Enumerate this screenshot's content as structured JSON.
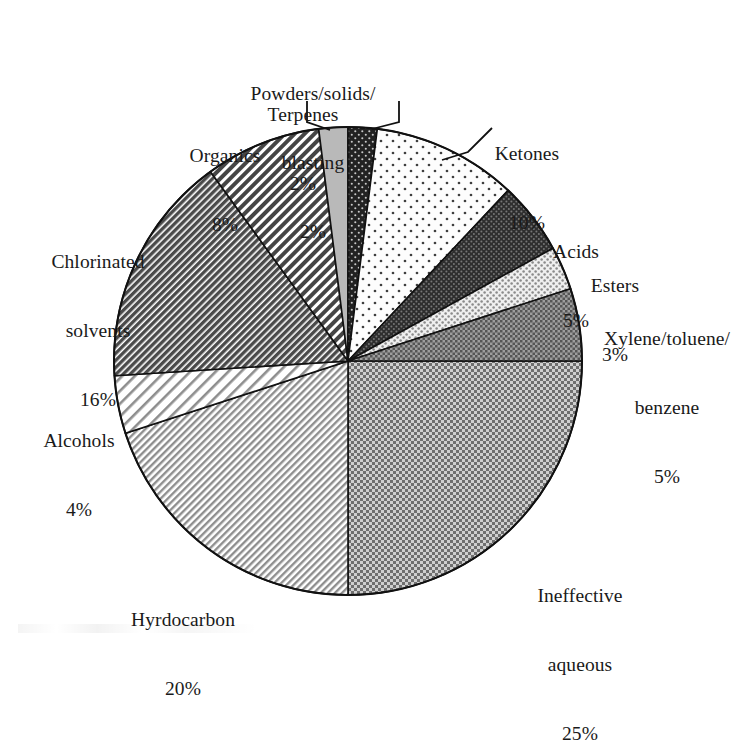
{
  "chart_data": {
    "type": "pie",
    "title": "",
    "subtitle": "",
    "xlabel": "",
    "ylabel": "",
    "legend_position": "none",
    "grid": false,
    "start_angle_deg": 0,
    "direction": "clockwise",
    "units": "percent",
    "total": 100,
    "categories": [
      "Ineffective aqueous",
      "Hyrdocarbon",
      "Alcohols",
      "Chlorinated solvents",
      "Organics",
      "Terpenes",
      "Powders/solids/blasting",
      "Ketones",
      "Acids",
      "Esters",
      "Xylene/toluene/benzene"
    ],
    "values": [
      25,
      20,
      4,
      16,
      8,
      2,
      2,
      10,
      5,
      3,
      5
    ],
    "slices": [
      {
        "key": "ineffective-aqueous",
        "label_lines": [
          "Ineffective",
          "aqueous"
        ],
        "percent_text": "25%",
        "value": 25,
        "start_deg": 0,
        "end_deg": 90,
        "pattern": "checker-medium-gray",
        "fill_hex": "#8c8c8c"
      },
      {
        "key": "hyrdocarbon",
        "label_lines": [
          "Hyrdocarbon"
        ],
        "percent_text": "20%",
        "value": 20,
        "start_deg": 90,
        "end_deg": 162,
        "pattern": "fine-diagonal-light",
        "fill_hex": "#b4b4b4"
      },
      {
        "key": "alcohols",
        "label_lines": [
          "Alcohols"
        ],
        "percent_text": "4%",
        "value": 4,
        "start_deg": 162,
        "end_deg": 176.4,
        "pattern": "wide-diagonal-light",
        "fill_hex": "#cccccc"
      },
      {
        "key": "chlorinated-solvents",
        "label_lines": [
          "Chlorinated",
          "solvents"
        ],
        "percent_text": "16%",
        "value": 16,
        "start_deg": 176.4,
        "end_deg": 234,
        "pattern": "dense-diagonal-dark",
        "fill_hex": "#6e6e6e"
      },
      {
        "key": "organics",
        "label_lines": [
          "Organics"
        ],
        "percent_text": "8%",
        "value": 8,
        "start_deg": 234,
        "end_deg": 262.8,
        "pattern": "medium-diagonal-dark",
        "fill_hex": "#7a7a7a"
      },
      {
        "key": "terpenes",
        "label_lines": [
          "Terpenes"
        ],
        "percent_text": "2%",
        "value": 2,
        "start_deg": 262.8,
        "end_deg": 270,
        "pattern": "solid-light-gray",
        "fill_hex": "#b9b9b9"
      },
      {
        "key": "powders-solids-blasting",
        "label_lines": [
          "Powders/solids/",
          "blasting"
        ],
        "percent_text": "2%",
        "value": 2,
        "start_deg": 270,
        "end_deg": 277.2,
        "pattern": "dark-speckle",
        "fill_hex": "#2b2b2b"
      },
      {
        "key": "ketones",
        "label_lines": [
          "Ketones"
        ],
        "percent_text": "10%",
        "value": 10,
        "start_deg": 277.2,
        "end_deg": 313.2,
        "pattern": "sparse-dots-white",
        "fill_hex": "#fafafa"
      },
      {
        "key": "acids",
        "label_lines": [
          "Acids"
        ],
        "percent_text": "5%",
        "value": 5,
        "start_deg": 313.2,
        "end_deg": 331.2,
        "pattern": "dense-dots-dark",
        "fill_hex": "#3a3a3a"
      },
      {
        "key": "esters",
        "label_lines": [
          "Esters"
        ],
        "percent_text": "3%",
        "value": 3,
        "start_deg": 331.2,
        "end_deg": 342,
        "pattern": "dots-on-light",
        "fill_hex": "#e6e6e6"
      },
      {
        "key": "xylene-toluene-benzene",
        "label_lines": [
          "Xylene/toluene/",
          "benzene"
        ],
        "percent_text": "5%",
        "value": 5,
        "start_deg": 342,
        "end_deg": 360,
        "pattern": "checker-dark-gray",
        "fill_hex": "#7d7d7d"
      }
    ]
  },
  "labels": {
    "ineffective_aqueous": {
      "l1": "Ineffective",
      "l2": "aqueous",
      "pct": "25%"
    },
    "hyrdocarbon": {
      "l1": "Hyrdocarbon",
      "pct": "20%"
    },
    "alcohols": {
      "l1": "Alcohols",
      "pct": "4%"
    },
    "chlorinated": {
      "l1": "Chlorinated",
      "l2": "solvents",
      "pct": "16%"
    },
    "organics": {
      "l1": "Organics",
      "pct": "8%"
    },
    "terpenes": {
      "l1": "Terpenes",
      "pct": "2%"
    },
    "powders": {
      "l1": "Powders/solids/",
      "l2": "blasting",
      "pct": "2%"
    },
    "ketones": {
      "l1": "Ketones",
      "pct": "10%"
    },
    "acids": {
      "l1": "Acids",
      "pct": "5%"
    },
    "esters": {
      "l1": "Esters",
      "pct": "3%"
    },
    "xylene": {
      "l1": "Xylene/toluene/",
      "l2": "benzene",
      "pct": "5%"
    }
  },
  "geometry": {
    "center_x": 348,
    "center_y": 361,
    "radius": 234
  },
  "colors": {
    "outline": "#111111",
    "text": "#1a1a1a",
    "background": "#ffffff"
  }
}
